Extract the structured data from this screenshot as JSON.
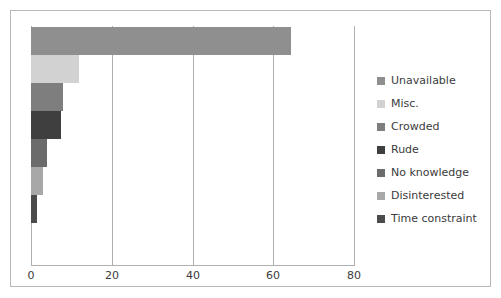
{
  "chart_data": {
    "type": "bar",
    "orientation": "horizontal",
    "title": "",
    "xlabel": "",
    "ylabel": "",
    "categories": [
      "Unavailable",
      "Misc.",
      "Crowded",
      "Rude",
      "No knowledge",
      "Disinterested",
      "Time constraint"
    ],
    "values": [
      64.5,
      12,
      8,
      7.5,
      4,
      3,
      1.5
    ],
    "colors": [
      "#8f8f8f",
      "#d2d2d2",
      "#7e7e7e",
      "#3f3f3f",
      "#6b6b6b",
      "#a8a8a8",
      "#4b4b4b"
    ],
    "xlim": [
      0,
      80
    ],
    "xticks": [
      0,
      20,
      40,
      60,
      80
    ],
    "xtick_labels": [
      "0",
      "20",
      "40",
      "60",
      "80"
    ],
    "grid": true,
    "grid_axis": "x",
    "legend_position": "right",
    "legend_entries": [
      {
        "label": "Unavailable",
        "color": "#8f8f8f"
      },
      {
        "label": "Misc.",
        "color": "#d2d2d2"
      },
      {
        "label": "Crowded",
        "color": "#7e7e7e"
      },
      {
        "label": "Rude",
        "color": "#3f3f3f"
      },
      {
        "label": "No knowledge",
        "color": "#6b6b6b"
      },
      {
        "label": "Disinterested",
        "color": "#a8a8a8"
      },
      {
        "label": "Time constraint",
        "color": "#4b4b4b"
      }
    ]
  }
}
